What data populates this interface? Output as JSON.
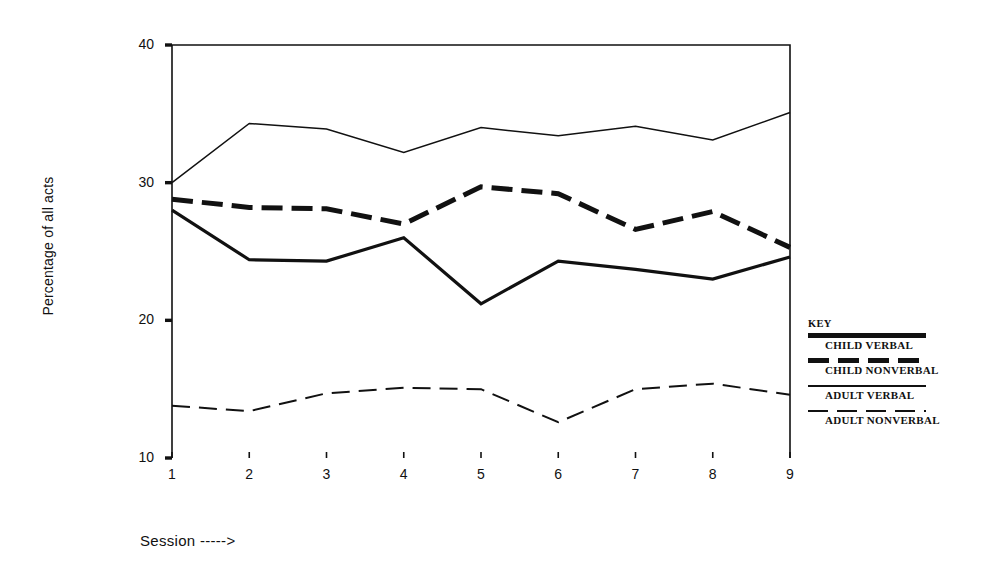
{
  "chart_data": {
    "type": "line",
    "title": "",
    "xlabel": "Session ----->",
    "ylabel": "Percentage of all acts",
    "x": [
      1,
      2,
      3,
      4,
      5,
      6,
      7,
      8,
      9
    ],
    "xtick_labels": [
      "1",
      "2",
      "3",
      "4",
      "5",
      "6",
      "7",
      "8",
      "9"
    ],
    "ytick_labels": [
      "40",
      "30",
      "20",
      "10"
    ],
    "ytick_values": [
      40,
      30,
      20,
      10
    ],
    "xlim": [
      1,
      9
    ],
    "ylim": [
      10,
      40
    ],
    "grid": false,
    "legend_position": "right",
    "series": [
      {
        "name": "CHILD VERBAL",
        "style": "thin-solid",
        "values": [
          30.0,
          34.3,
          33.9,
          32.2,
          34.0,
          33.4,
          34.1,
          33.1,
          35.1
        ]
      },
      {
        "name": "CHILD NONVERBAL",
        "style": "thick-dash",
        "values": [
          28.8,
          28.2,
          28.1,
          27.0,
          29.7,
          29.2,
          26.6,
          27.9,
          25.3
        ]
      },
      {
        "name": "ADULT VERBAL",
        "style": "thick-solid",
        "values": [
          28.0,
          24.4,
          24.3,
          26.0,
          21.2,
          24.3,
          23.7,
          23.0,
          24.6
        ]
      },
      {
        "name": "ADULT NONVERBAL",
        "style": "thin-dash",
        "values": [
          13.8,
          13.4,
          14.7,
          15.1,
          15.0,
          12.6,
          15.0,
          15.4,
          14.6
        ]
      }
    ]
  },
  "legend": {
    "title": "KEY",
    "entries": [
      {
        "label": "CHILD VERBAL",
        "style": "thick-solid"
      },
      {
        "label": "CHILD NONVERBAL",
        "style": "thick-dash"
      },
      {
        "label": "ADULT VERBAL",
        "style": "thin-solid"
      },
      {
        "label": "ADULT NONVERBAL",
        "style": "thin-dash"
      }
    ]
  },
  "colors": {
    "ink": "#111111",
    "background": "#ffffff"
  }
}
